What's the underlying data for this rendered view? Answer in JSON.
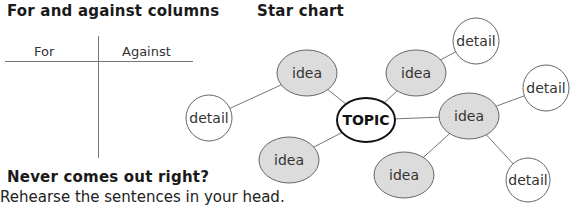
{
  "left_section": {
    "title": "For and against columns",
    "columns": [
      "For",
      "Against"
    ]
  },
  "right_section": {
    "title": "Star chart"
  },
  "tip": {
    "heading": "Never comes out right?",
    "text": "Rehearse the sentences in your head."
  },
  "diagram": {
    "center": {
      "label": "TOPIC",
      "x": 366,
      "y": 120,
      "rx": 29,
      "ry": 22
    },
    "ideas": [
      {
        "label": "idea",
        "x": 307,
        "y": 73
      },
      {
        "label": "idea",
        "x": 416,
        "y": 73
      },
      {
        "label": "idea",
        "x": 469,
        "y": 116
      },
      {
        "label": "idea",
        "x": 289,
        "y": 160
      },
      {
        "label": "idea",
        "x": 404,
        "y": 175
      }
    ],
    "details": [
      {
        "label": "detail",
        "x": 476,
        "y": 41
      },
      {
        "label": "detail",
        "x": 546,
        "y": 88
      },
      {
        "label": "detail",
        "x": 209,
        "y": 118
      },
      {
        "label": "detail",
        "x": 528,
        "y": 180
      }
    ],
    "colors": {
      "idea_fill": "#dcdcdc",
      "stroke": "#555555",
      "line": "#777777",
      "detail_fill": "#ffffff"
    }
  }
}
